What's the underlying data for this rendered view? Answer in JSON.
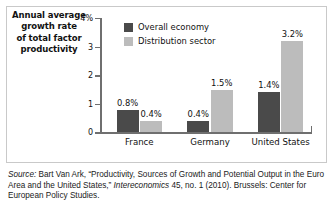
{
  "chart_data": {
    "type": "bar",
    "title": "Annual average growth rate of total factor productivity",
    "xlabel": "",
    "ylabel": "",
    "ylim": [
      0,
      4
    ],
    "yticks": [
      "0",
      "1",
      "2",
      "3",
      "4%"
    ],
    "ytick_values": [
      0,
      1,
      2,
      3,
      4
    ],
    "grid": false,
    "legend_position": "top-left-inside",
    "categories": [
      "France",
      "Germany",
      "United States"
    ],
    "series": [
      {
        "name": "Overall economy",
        "color": "#4a4a4a",
        "values": [
          0.8,
          0.4,
          1.4
        ],
        "labels": [
          "0.8%",
          "0.4%",
          "1.4%"
        ]
      },
      {
        "name": "Distribution sector",
        "color": "#bcbcbc",
        "values": [
          0.4,
          1.5,
          3.2
        ],
        "labels": [
          "0.4%",
          "1.5%",
          "3.2%"
        ]
      }
    ]
  },
  "title_lines": [
    "Annual average",
    "growth rate",
    "of total factor",
    "productivity"
  ],
  "source": {
    "label": "Source:",
    "text": " Bart Van Ark, “Productivity, Sources of Growth and Potential Output in the Euro Area and the United States,” ",
    "journal": "Intereconomics",
    "tail": " 45, no. 1 (2010). Brussels: Center for European Policy Studies."
  },
  "colors": {
    "series_1": "#4a4a4a",
    "series_2": "#bcbcbc",
    "axis": "#6f6f6f",
    "frame": "#c9c9c9",
    "text": "#111111"
  }
}
